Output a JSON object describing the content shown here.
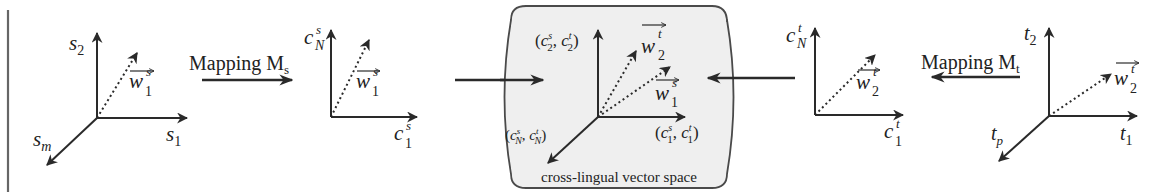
{
  "figure": {
    "colors": {
      "ink": "#2a2a2a",
      "box_fill": "#efefef",
      "box_stroke": "#4a4a4a",
      "left_rule": "#666666"
    }
  },
  "source_space": {
    "axes": {
      "up": "s",
      "up_sub": "2",
      "right": "s",
      "right_sub": "1",
      "diag": "s",
      "diag_sub": "m"
    },
    "vector": {
      "base": "w",
      "sub": "1",
      "sup": "s"
    }
  },
  "mapping_source": {
    "label": "Mapping M",
    "sub": "s"
  },
  "source_concept_space": {
    "axes": {
      "up": "c",
      "up_sub": "N",
      "up_sup": "s",
      "right": "c",
      "right_sub": "1",
      "right_sup": "s"
    },
    "vector": {
      "base": "w",
      "sub": "1",
      "sup": "s"
    }
  },
  "cross_lingual_space": {
    "caption": "cross-lingual vector space",
    "axes": {
      "up": {
        "a_sub": "2",
        "a_sup": "s",
        "b_sub": "2",
        "b_sup": "t"
      },
      "right": {
        "a_sub": "1",
        "a_sup": "s",
        "b_sub": "1",
        "b_sup": "t"
      },
      "diag": {
        "a_sub": "N",
        "a_sup": "s",
        "b_sub": "N",
        "b_sup": "t"
      }
    },
    "vectors": [
      {
        "base": "w",
        "sub": "2",
        "sup": "t"
      },
      {
        "base": "w",
        "sub": "1",
        "sup": "s"
      }
    ]
  },
  "target_concept_space": {
    "axes": {
      "up": "c",
      "up_sub": "N",
      "up_sup": "t",
      "right": "c",
      "right_sub": "1",
      "right_sup": "t"
    },
    "vector": {
      "base": "w",
      "sub": "2",
      "sup": "t"
    }
  },
  "mapping_target": {
    "label": "Mapping M",
    "sub": "t"
  },
  "target_space": {
    "axes": {
      "up": "t",
      "up_sub": "2",
      "right": "t",
      "right_sub": "1",
      "diag": "t",
      "diag_sub": "p"
    },
    "vector": {
      "base": "w",
      "sub": "2",
      "sup": "t"
    }
  },
  "punct": {
    "open": "(",
    "comma": ", ",
    "close": ")"
  }
}
